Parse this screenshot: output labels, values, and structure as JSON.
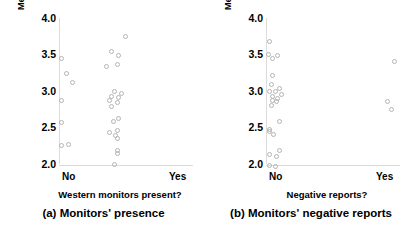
{
  "figure": {
    "background": "#ffffff",
    "point_color": "#b4b4b4",
    "axis_color": "#dcdcdc"
  },
  "panels": [
    {
      "id": "a",
      "caption": "(a) Monitors' presence",
      "y_title": "Mean perceived credibility",
      "x_title": "Western monitors present?",
      "x_ticks": [
        "No",
        "Yes"
      ],
      "y_ticks": [
        "4.0",
        "3.5",
        "3.0",
        "2.5",
        "2.0"
      ]
    },
    {
      "id": "b",
      "caption": "(b) Monitors' negative reports",
      "y_title": "Mean perceived credibility",
      "x_title": "Negative reports?",
      "x_ticks": [
        "No",
        "Yes"
      ],
      "y_ticks": [
        "4.0",
        "3.5",
        "3.0",
        "2.5",
        "2.0"
      ]
    }
  ],
  "chart_data": [
    {
      "type": "scatter",
      "title": "(a) Monitors' presence",
      "xlabel": "Western monitors present?",
      "ylabel": "Mean perceived credibility",
      "ylim": [
        2.0,
        4.0
      ],
      "yticks": [
        2.0,
        2.5,
        3.0,
        3.5,
        4.0
      ],
      "categories": [
        "No",
        "Yes"
      ],
      "grid": false,
      "legend": "none",
      "series": [
        {
          "name": "No",
          "x_jitter": [
            0.02,
            0.06,
            0.1,
            0.02,
            0.02,
            0.02,
            0.07
          ],
          "values": [
            3.44,
            3.24,
            3.11,
            2.87,
            2.57,
            2.25,
            2.27
          ]
        },
        {
          "name": "Yes",
          "x_jitter": [
            0.5,
            0.4,
            0.45,
            0.44,
            0.36,
            0.42,
            0.47,
            0.4,
            0.45,
            0.38,
            0.44,
            0.4,
            0.45,
            0.41,
            0.44,
            0.38,
            0.43,
            0.44,
            0.44,
            0.44,
            0.42
          ],
          "values": [
            3.74,
            3.54,
            3.48,
            3.36,
            3.33,
            3.0,
            2.97,
            2.93,
            2.91,
            2.87,
            2.84,
            2.79,
            2.63,
            2.58,
            2.46,
            2.43,
            2.39,
            2.35,
            2.19,
            2.14,
            1.99
          ]
        }
      ]
    },
    {
      "type": "scatter",
      "title": "(b) Monitors' negative reports",
      "xlabel": "Negative reports?",
      "ylabel": "Mean perceived credibility",
      "ylim": [
        2.0,
        4.0
      ],
      "yticks": [
        2.0,
        2.5,
        3.0,
        3.5,
        4.0
      ],
      "categories": [
        "No",
        "Yes"
      ],
      "grid": false,
      "legend": "none",
      "series": [
        {
          "name": "No",
          "x_jitter": [
            0.03,
            0.02,
            0.09,
            0.05,
            0.05,
            0.04,
            0.1,
            0.03,
            0.07,
            0.12,
            0.05,
            0.09,
            0.05,
            0.08,
            0.04,
            0.1,
            0.03,
            0.03,
            0.06,
            0.1,
            0.03,
            0.08,
            0.03,
            0.07
          ],
          "values": [
            3.68,
            3.5,
            3.49,
            3.44,
            3.21,
            3.09,
            3.04,
            3.0,
            2.99,
            2.95,
            2.92,
            2.9,
            2.87,
            2.85,
            2.8,
            2.58,
            2.47,
            2.44,
            2.41,
            2.19,
            2.13,
            2.1,
            1.98,
            1.97
          ]
        },
        {
          "name": "Yes",
          "x_jitter": [
            0.97,
            0.92,
            0.95
          ],
          "values": [
            3.4,
            2.85,
            2.75
          ]
        }
      ]
    }
  ]
}
